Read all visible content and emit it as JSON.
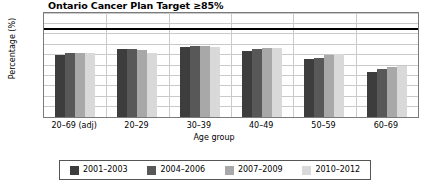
{
  "chart_data": {
    "type": "bar",
    "title": "Ontario Cancer Plan Target ≥85%",
    "xlabel": "Age group",
    "ylabel": "Percentage (%)",
    "ylim": [
      0,
      100
    ],
    "yticks": [
      0,
      10,
      20,
      30,
      40,
      50,
      60,
      70,
      80,
      90,
      100
    ],
    "grid": true,
    "legend_position": "bottom",
    "categories": [
      "20–69 (adj)",
      "20–29",
      "30–39",
      "40–49",
      "50–59",
      "60–69"
    ],
    "series": [
      {
        "name": "2001–2003",
        "color": "#3d3d3d",
        "values": [
          60,
          65,
          67,
          63,
          56,
          43
        ]
      },
      {
        "name": "2004–2006",
        "color": "#585858",
        "values": [
          62,
          65,
          68,
          65,
          57,
          46
        ]
      },
      {
        "name": "2007–2009",
        "color": "#a8a8a8",
        "values": [
          62,
          64,
          68,
          66,
          60,
          48
        ]
      },
      {
        "name": "2010–2012",
        "color": "#d9d9d9",
        "values": [
          62,
          62,
          67,
          66,
          61,
          49
        ]
      }
    ],
    "annotations": [
      {
        "name": "target-line",
        "type": "hline",
        "value": 85,
        "color": "#000000",
        "label": "Ontario Cancer Plan Target ≥85%"
      }
    ]
  }
}
